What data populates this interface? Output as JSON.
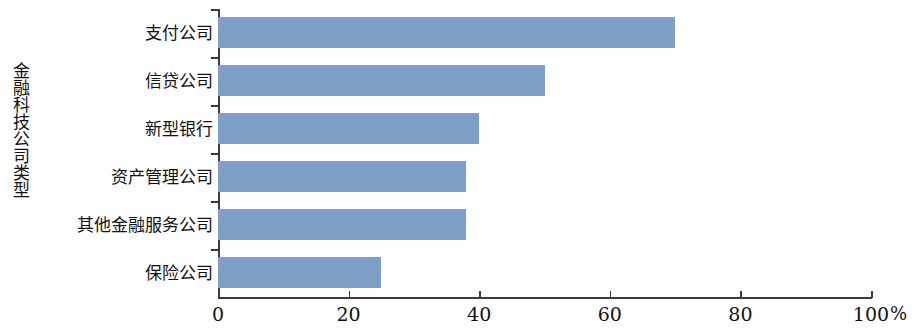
{
  "chart_data": {
    "type": "bar",
    "orientation": "horizontal",
    "title": "",
    "xlabel": "%",
    "ylabel": "金融科技公司类型",
    "categories": [
      "支付公司",
      "信贷公司",
      "新型银行",
      "资产管理公司",
      "其他金融服务公司",
      "保险公司"
    ],
    "values": [
      70,
      50,
      40,
      38,
      38,
      25
    ],
    "xlim": [
      0,
      100
    ],
    "xticks": [
      0,
      20,
      40,
      60,
      80,
      100
    ],
    "xtick_labels": [
      "0",
      "20",
      "40",
      "60",
      "80",
      "100"
    ],
    "grid": false,
    "legend": null,
    "series": [
      {
        "name": "占比",
        "values": [
          70,
          50,
          40,
          38,
          38,
          25
        ]
      }
    ],
    "colors": {
      "bar": "#7e9fc8",
      "axis": "#3a3a3a",
      "text": "#111111",
      "background": "#ffffff"
    }
  }
}
